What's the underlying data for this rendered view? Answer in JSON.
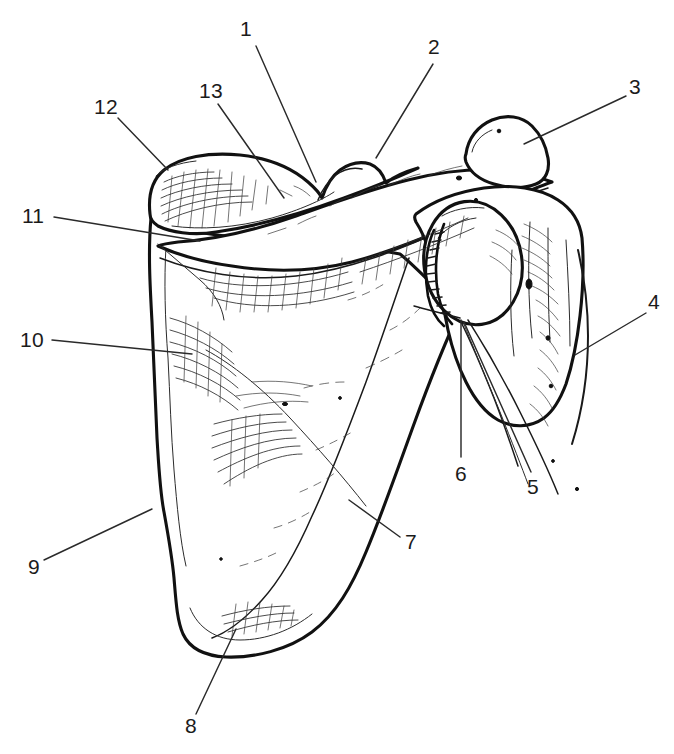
{
  "figure": {
    "kind": "anatomical-line-drawing",
    "background_color": "#ffffff",
    "ink_color": "#111111",
    "label_color": "#1b1b1b",
    "width": 674,
    "height": 754
  },
  "callouts": [
    {
      "id": "1",
      "text": "1",
      "x": 240,
      "y": 18,
      "leader": "M 256 46 L 316 182"
    },
    {
      "id": "2",
      "text": "2",
      "x": 428,
      "y": 36,
      "leader": "M 433 64 L 376 158"
    },
    {
      "id": "3",
      "text": "3",
      "x": 629,
      "y": 76,
      "leader": "M 626 96 L 524 144"
    },
    {
      "id": "4",
      "text": "4",
      "x": 648,
      "y": 291,
      "leader": "M 646 313 L 575 355"
    },
    {
      "id": "5",
      "text": "5",
      "x": 527,
      "y": 476,
      "leader": "M 531 472 L 464 322"
    },
    {
      "id": "6",
      "text": "6",
      "x": 455,
      "y": 463,
      "leader": "M 461 457 L 461 320"
    },
    {
      "id": "7",
      "text": "7",
      "x": 405,
      "y": 531,
      "leader": "M 400 537 L 349 500"
    },
    {
      "id": "8",
      "text": "8",
      "x": 185,
      "y": 715,
      "leader": "M 196 714 L 236 629"
    },
    {
      "id": "9",
      "text": "9",
      "x": 28,
      "y": 556,
      "leader": "M 44 560 L 152 509"
    },
    {
      "id": "10",
      "text": "10",
      "x": 20,
      "y": 329,
      "leader": "M 52 340 L 192 354"
    },
    {
      "id": "11",
      "text": "11",
      "x": 22,
      "y": 205,
      "leader": "M 54 217 L 200 241"
    },
    {
      "id": "12",
      "text": "12",
      "x": 94,
      "y": 96,
      "leader": "M 118 118 L 168 170"
    },
    {
      "id": "13",
      "text": "13",
      "x": 199,
      "y": 80,
      "leader": "M 218 104 L 284 198"
    }
  ]
}
